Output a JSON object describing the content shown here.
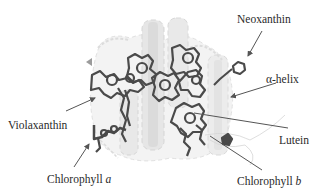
{
  "figure": {
    "colors": {
      "text": "#2a2a2a",
      "arrow": "#555555",
      "helix_light": "#d9d9d9",
      "helix_mid": "#bdbdbd",
      "pigment": "#4a4a4a"
    },
    "labels": [
      {
        "id": "neoxanthin",
        "text": "Neoxanthin",
        "italic_suffix": ""
      },
      {
        "id": "alpha-helix",
        "text": "α-helix",
        "italic_suffix": ""
      },
      {
        "id": "violaxanthin",
        "text": "Violaxanthin",
        "italic_suffix": ""
      },
      {
        "id": "chlorophyll-a",
        "text": "Chlorophyll ",
        "italic_suffix": "a"
      },
      {
        "id": "lutein",
        "text": "Lutein",
        "italic_suffix": ""
      },
      {
        "id": "chlorophyll-b",
        "text": "Chlorophyll ",
        "italic_suffix": "b"
      }
    ]
  }
}
